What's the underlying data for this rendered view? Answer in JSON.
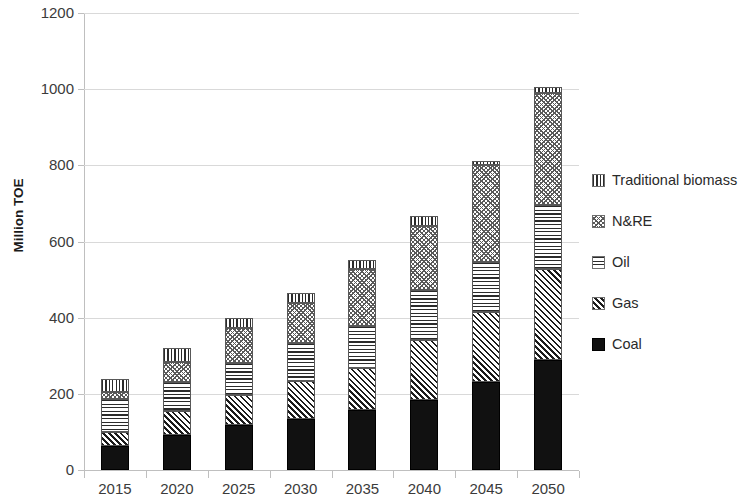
{
  "chart_data": {
    "type": "bar",
    "subtype": "stacked-bar",
    "title": "",
    "xlabel": "",
    "ylabel": "Million TOE",
    "ylim": [
      0,
      1200
    ],
    "ytick_step": 200,
    "ytick_labels": [
      "1200",
      "1000",
      "800",
      "600",
      "400",
      "200",
      "0"
    ],
    "ytick_values": [
      1200,
      1000,
      800,
      600,
      400,
      200,
      0
    ],
    "grid": true,
    "grid_axis": "y",
    "legend_position": "right",
    "categories": [
      "2015",
      "2020",
      "2025",
      "2030",
      "2035",
      "2040",
      "2045",
      "2050"
    ],
    "stack_order_bottom_to_top": [
      "Coal",
      "Gas",
      "Oil",
      "N&RE",
      "Traditional biomass"
    ],
    "series": [
      {
        "name": "Coal",
        "pattern": "solid-black",
        "color": "#111111",
        "values": [
          63,
          92,
          118,
          134,
          157,
          184,
          231,
          288
        ]
      },
      {
        "name": "Gas",
        "pattern": "diagonal-stripes",
        "color": "#1c1c1c",
        "values": [
          37,
          63,
          79,
          99,
          110,
          157,
          184,
          239
        ]
      },
      {
        "name": "Oil",
        "pattern": "horizontal-stripes",
        "color": "#2b2b2b",
        "values": [
          86,
          76,
          84,
          100,
          110,
          131,
          131,
          168
        ]
      },
      {
        "name": "N&RE",
        "pattern": "cross-hatch-mesh",
        "color": "#595959",
        "values": [
          19,
          52,
          91,
          105,
          150,
          168,
          254,
          296
        ]
      },
      {
        "name": "Traditional biomass",
        "pattern": "vertical-stripes",
        "color": "#2b2b2b",
        "values": [
          34,
          37,
          26,
          26,
          24,
          26,
          11,
          16
        ]
      }
    ],
    "totals": [
      239,
      320,
      398,
      464,
      551,
      666,
      811,
      1007
    ]
  },
  "legend": {
    "items": [
      {
        "label": "Traditional biomass",
        "pattern_class": "pat-biomass",
        "icon": "vertical-stripes-swatch-icon"
      },
      {
        "label": "N&RE",
        "pattern_class": "pat-nre",
        "icon": "cross-hatch-swatch-icon"
      },
      {
        "label": "Oil",
        "pattern_class": "pat-oil",
        "icon": "horizontal-stripes-swatch-icon"
      },
      {
        "label": "Gas",
        "pattern_class": "pat-gas",
        "icon": "diagonal-stripes-swatch-icon"
      },
      {
        "label": "Coal",
        "pattern_class": "pat-coal",
        "icon": "solid-black-swatch-icon"
      }
    ]
  }
}
